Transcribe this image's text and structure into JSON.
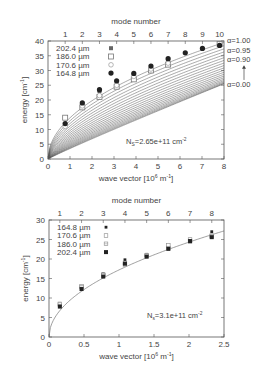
{
  "chart_data": [
    {
      "type": "scatter",
      "title": "",
      "top_axis_label": "mode number",
      "top_ticks": [
        1,
        2,
        3,
        4,
        5,
        6,
        7,
        8,
        9,
        10
      ],
      "xlabel": "wave vector [10^6 m^-1]",
      "xlabel_parts": {
        "pre": "wave vector [10",
        "sup1": "6",
        "mid": " m",
        "sup2": "-1",
        "post": "]"
      },
      "ylabel": "energy [cm^-1]",
      "ylabel_parts": {
        "pre": "energy [cm",
        "sup": "-1",
        "post": "]"
      },
      "xlim": [
        0,
        8
      ],
      "ylim": [
        0,
        40
      ],
      "xticks": [
        0,
        1,
        2,
        3,
        4,
        5,
        6,
        7,
        8
      ],
      "yticks": [
        0,
        5,
        10,
        15,
        20,
        25,
        30,
        35,
        40
      ],
      "grid": false,
      "legend_position": "upper left",
      "annotation": {
        "pre": "N",
        "sub": "S",
        "mid": "=2.65e+11 cm",
        "sup": "-2"
      },
      "curve_labels": [
        "α=1.00",
        "α=0.95",
        "α=0.90",
        "α=0.00"
      ],
      "curves": {
        "alpha_min": 0.0,
        "alpha_max": 1.0,
        "count": 21,
        "top_energy_at_k8": 39.5,
        "bottom_energy_at_k8": 25.5
      },
      "x": [
        0.78,
        1.56,
        2.34,
        3.12,
        3.9,
        4.68,
        5.46,
        6.24,
        7.02,
        7.8
      ],
      "series": [
        {
          "name": "202.4 µm",
          "marker": "asterisk",
          "values": [
            11.5,
            18.5,
            23.0,
            26.0,
            28.5,
            31.0,
            33.0,
            null,
            null,
            null
          ]
        },
        {
          "name": "186.0 µm",
          "marker": "open-square",
          "values": [
            14.0,
            17.5,
            21.0,
            24.5,
            27.0,
            30.0,
            32.0,
            null,
            null,
            39.0
          ]
        },
        {
          "name": "170.6 µm",
          "marker": "open-circle",
          "values": [
            11.0,
            18.0,
            21.5,
            25.0,
            28.0,
            30.5,
            32.5,
            null,
            null,
            null
          ]
        },
        {
          "name": "164.8 µm",
          "marker": "filled-circle",
          "values": [
            12.0,
            19.0,
            23.5,
            26.5,
            29.0,
            31.5,
            34.0,
            36.0,
            37.5,
            38.5
          ]
        }
      ]
    },
    {
      "type": "scatter",
      "title": "",
      "top_axis_label": "mode number",
      "top_ticks": [
        1,
        2,
        3,
        4,
        5,
        6,
        7,
        8
      ],
      "xlabel": "wave vector [10^6 m^-1]",
      "xlabel_parts": {
        "pre": "wave vector [10",
        "sup1": "6",
        "mid": " m",
        "sup2": "-1",
        "post": "]"
      },
      "ylabel": "energy [cm^-1]",
      "ylabel_parts": {
        "pre": "energy [cm",
        "sup": "-1",
        "post": "]"
      },
      "xlim": [
        0,
        2.5
      ],
      "ylim": [
        0,
        30
      ],
      "xticks": [
        0,
        0.5,
        1,
        1.5,
        2,
        2.5
      ],
      "yticks": [
        0,
        5,
        10,
        15,
        20,
        25,
        30
      ],
      "grid": false,
      "legend_position": "upper left",
      "annotation": {
        "pre": "N",
        "sub": "s",
        "mid": "=3.1e+11 cm",
        "sup": "-2"
      },
      "curve": {
        "coefficient": 17.2,
        "exponent": 0.5
      },
      "x": [
        0.155,
        0.465,
        0.775,
        1.085,
        1.395,
        1.705,
        2.015,
        2.325
      ],
      "series": [
        {
          "name": "164.8 µm",
          "marker": "small-filled-square",
          "values": [
            8.0,
            12.5,
            16.2,
            19.8,
            21.2,
            23.0,
            24.8,
            27.0
          ]
        },
        {
          "name": "170.6 µm",
          "marker": "small-open-square",
          "values": [
            8.5,
            13.0,
            16.0,
            19.0,
            21.0,
            23.5,
            25.0,
            26.0
          ]
        },
        {
          "name": "186.0 µm",
          "marker": "small-crossed-square",
          "values": [
            8.3,
            12.8,
            15.8,
            18.5,
            20.8,
            22.8,
            24.5,
            25.8
          ]
        },
        {
          "name": "202.4 µm",
          "marker": "filled-square",
          "values": [
            7.8,
            12.3,
            15.5,
            18.8,
            20.6,
            22.6,
            24.6,
            25.6
          ]
        }
      ]
    }
  ],
  "layout": {
    "plots": [
      {
        "x0": 48,
        "x1": 224,
        "y0": 41,
        "y1": 159
      },
      {
        "x0": 49,
        "x1": 224,
        "y0": 220,
        "y1": 337
      }
    ]
  }
}
